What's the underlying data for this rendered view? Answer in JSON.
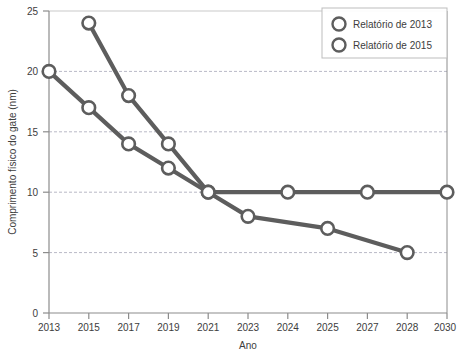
{
  "chart_data": {
    "type": "line",
    "title": "",
    "xlabel": "Ano",
    "ylabel": "Comprimento físico do gate (nm)",
    "categories": [
      "2013",
      "2015",
      "2017",
      "2019",
      "2021",
      "2023",
      "2024",
      "2025",
      "2027",
      "2028",
      "2030"
    ],
    "xtick_labels": [
      "2013",
      "2015",
      "2017",
      "2019",
      "2021",
      "2023",
      "2024",
      "2025",
      "2027",
      "2028",
      "2030"
    ],
    "ytick_labels": [
      "0",
      "5",
      "10",
      "15",
      "20",
      "25"
    ],
    "yticks": [
      0,
      5,
      10,
      15,
      20,
      25
    ],
    "ylim": [
      0,
      25
    ],
    "grid": "horizontal-dashed",
    "legend_position": "top-right",
    "series": [
      {
        "name": "Relatório de 2013",
        "color": "#5d5d5d",
        "points": [
          {
            "x": "2015",
            "y": 24
          },
          {
            "x": "2017",
            "y": 18
          },
          {
            "x": "2019",
            "y": 14
          },
          {
            "x": "2021",
            "y": 10
          },
          {
            "x": "2024",
            "y": 10
          },
          {
            "x": "2027",
            "y": 10
          },
          {
            "x": "2030",
            "y": 10
          }
        ]
      },
      {
        "name": "Relatório de 2015",
        "color": "#5d5d5d",
        "points": [
          {
            "x": "2013",
            "y": 20
          },
          {
            "x": "2015",
            "y": 17
          },
          {
            "x": "2017",
            "y": 14
          },
          {
            "x": "2019",
            "y": 12
          },
          {
            "x": "2021",
            "y": 10
          },
          {
            "x": "2023",
            "y": 8
          },
          {
            "x": "2025",
            "y": 7
          },
          {
            "x": "2028",
            "y": 5
          }
        ]
      }
    ]
  },
  "axes": {
    "y_title": "Comprimento físico do gate (nm)",
    "x_title": "Ano",
    "y_ticks": [
      "25",
      "20",
      "15",
      "10",
      "5",
      "0"
    ],
    "x_ticks": [
      "2013",
      "2015",
      "2017",
      "2019",
      "2021",
      "2023",
      "2024",
      "2025",
      "2027",
      "2028",
      "2030"
    ]
  },
  "legend": {
    "items": [
      {
        "label": "Relatório de 2013",
        "marker": "circle-outline-icon"
      },
      {
        "label": "Relatório de 2015",
        "marker": "circle-outline-icon"
      }
    ]
  },
  "colors": {
    "line": "#5d5d5d",
    "marker_stroke": "#5d5d5d",
    "marker_fill": "#ffffff",
    "axis": "#8c8c8c",
    "grid": "#b9b9c6",
    "legend_border": "#bdbdbd",
    "text": "#3d3d3d"
  }
}
